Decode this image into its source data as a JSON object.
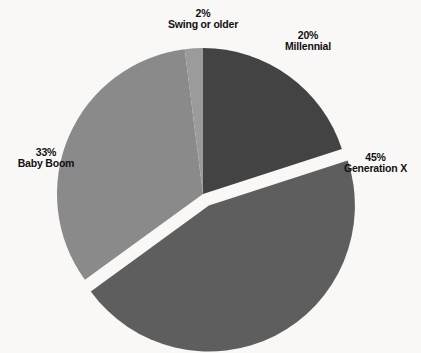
{
  "chart_data": {
    "type": "pie",
    "title": "",
    "subtitle": "",
    "xlabel": "",
    "ylabel": "",
    "legend_position": "none",
    "grid": false,
    "label_format": "percent-above-name",
    "start_angle_deg": 0,
    "direction": "clockwise",
    "exploded_slice": "Generation X",
    "background_color": "#f9f8f6",
    "categories": [
      "Millennial",
      "Generation X",
      "Baby Boom",
      "Swing or older"
    ],
    "values": [
      20,
      45,
      33,
      2
    ],
    "colors": [
      "#434343",
      "#5e5e5e",
      "#8a8a8a",
      "#9b9b9b"
    ],
    "slices": [
      {
        "name": "Millennial",
        "value": 20,
        "percent_label": "20%",
        "color": "#434343",
        "exploded": false,
        "start_angle_deg": 0,
        "end_angle_deg": 72
      },
      {
        "name": "Generation X",
        "value": 45,
        "percent_label": "45%",
        "color": "#5e5e5e",
        "exploded": true,
        "start_angle_deg": 72,
        "end_angle_deg": 234
      },
      {
        "name": "Baby Boom",
        "value": 33,
        "percent_label": "33%",
        "color": "#8a8a8a",
        "exploded": false,
        "start_angle_deg": 234,
        "end_angle_deg": 352.8
      },
      {
        "name": "Swing or older",
        "value": 2,
        "percent_label": "2%",
        "color": "#9b9b9b",
        "exploded": false,
        "start_angle_deg": 352.8,
        "end_angle_deg": 360
      }
    ],
    "labels": [
      {
        "percent": "2%",
        "name": "Swing or older"
      },
      {
        "percent": "20%",
        "name": "Millennial"
      },
      {
        "percent": "45%",
        "name": "Generation X"
      },
      {
        "percent": "33%",
        "name": "Baby Boom"
      }
    ]
  }
}
